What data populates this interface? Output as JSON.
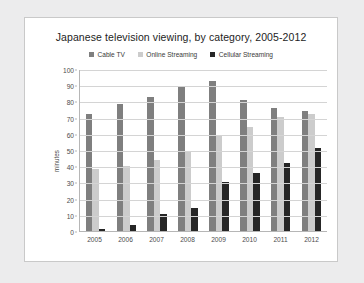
{
  "chart_data": {
    "type": "bar",
    "title": "Japanese television viewing, by category, 2005-2012",
    "xlabel": "",
    "ylabel": "minutes",
    "ylim": [
      0,
      100
    ],
    "yticks": [
      100,
      90,
      80,
      70,
      60,
      50,
      40,
      30,
      20,
      10,
      0
    ],
    "grid": true,
    "legend_position": "top-center",
    "categories": [
      "2005",
      "2006",
      "2007",
      "2008",
      "2009",
      "2010",
      "2011",
      "2012"
    ],
    "series": [
      {
        "name": "Cable TV",
        "color": "#7f7f7f",
        "values": [
          72,
          78.5,
          83,
          89,
          92.5,
          81,
          76,
          74
        ]
      },
      {
        "name": "Online Streaming",
        "color": "#cccccc",
        "values": [
          38,
          40,
          44,
          48.5,
          59,
          64.5,
          70.5,
          72
        ]
      },
      {
        "name": "Cellular Streaming",
        "color": "#262626",
        "values": [
          1.5,
          4,
          10.5,
          14,
          30,
          36,
          42,
          51
        ]
      }
    ]
  }
}
